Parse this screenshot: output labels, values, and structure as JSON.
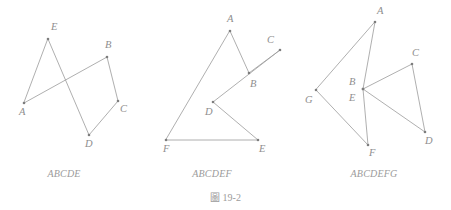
{
  "plate": {
    "caption": "圖 19-2",
    "background_color": "#ffffff",
    "line_color": "#9a9a9a",
    "vertex_color": "#7d7d7d",
    "label_color": "#8e8e8e",
    "caption_color": "#9b9b9b"
  },
  "figures": [
    {
      "id": "figure-abcde",
      "caption": "ABCDE",
      "caption_x": 64,
      "caption_y": 168,
      "closed": true,
      "path": "24,103 107,57 118,101 89,135 48,39",
      "vertices": [
        {
          "name": "A",
          "x": 24,
          "y": 103,
          "label": "A",
          "lx": 19,
          "ly": 107
        },
        {
          "name": "B",
          "x": 107,
          "y": 57,
          "label": "B",
          "lx": 105,
          "ly": 40
        },
        {
          "name": "C",
          "x": 118,
          "y": 101,
          "label": "C",
          "lx": 120,
          "ly": 104
        },
        {
          "name": "D",
          "x": 89,
          "y": 135,
          "label": "D",
          "lx": 85,
          "ly": 139
        },
        {
          "name": "E",
          "x": 48,
          "y": 39,
          "label": "E",
          "lx": 51,
          "ly": 22
        }
      ]
    },
    {
      "id": "figure-abcdef",
      "caption": "ABCDEF",
      "caption_x": 212,
      "caption_y": 168,
      "closed": true,
      "path": "230,31 249,73 280,50 213,102 258,140 166,140",
      "vertices": [
        {
          "name": "A",
          "x": 230,
          "y": 31,
          "label": "A",
          "lx": 227,
          "ly": 14
        },
        {
          "name": "B",
          "x": 249,
          "y": 73,
          "label": "B",
          "lx": 250,
          "ly": 79
        },
        {
          "name": "C",
          "x": 280,
          "y": 50,
          "label": "C",
          "lx": 267,
          "ly": 35
        },
        {
          "name": "D",
          "x": 213,
          "y": 102,
          "label": "D",
          "lx": 205,
          "ly": 107
        },
        {
          "name": "E",
          "x": 258,
          "y": 140,
          "label": "E",
          "lx": 259,
          "ly": 144
        },
        {
          "name": "F",
          "x": 166,
          "y": 140,
          "label": "F",
          "lx": 163,
          "ly": 144
        }
      ]
    },
    {
      "id": "figure-abcdefg",
      "caption": "ABCDEFG",
      "caption_x": 374,
      "caption_y": 168,
      "closed": true,
      "path": "375,22 363,89 412,64 425,132 363,89 368,145 316,90",
      "vertices": [
        {
          "name": "A",
          "x": 375,
          "y": 22,
          "label": "A",
          "lx": 377,
          "ly": 6
        },
        {
          "name": "B",
          "x": 363,
          "y": 89,
          "label": "B",
          "lx": 349,
          "ly": 77
        },
        {
          "name": "C",
          "x": 412,
          "y": 64,
          "label": "C",
          "lx": 412,
          "ly": 48
        },
        {
          "name": "D",
          "x": 425,
          "y": 132,
          "label": "D",
          "lx": 425,
          "ly": 136
        },
        {
          "name": "E",
          "x": 363,
          "y": 89,
          "label": "E",
          "lx": 349,
          "ly": 93
        },
        {
          "name": "F",
          "x": 368,
          "y": 145,
          "label": "F",
          "lx": 369,
          "ly": 148
        },
        {
          "name": "G",
          "x": 316,
          "y": 90,
          "label": "G",
          "lx": 305,
          "ly": 95
        }
      ]
    }
  ]
}
